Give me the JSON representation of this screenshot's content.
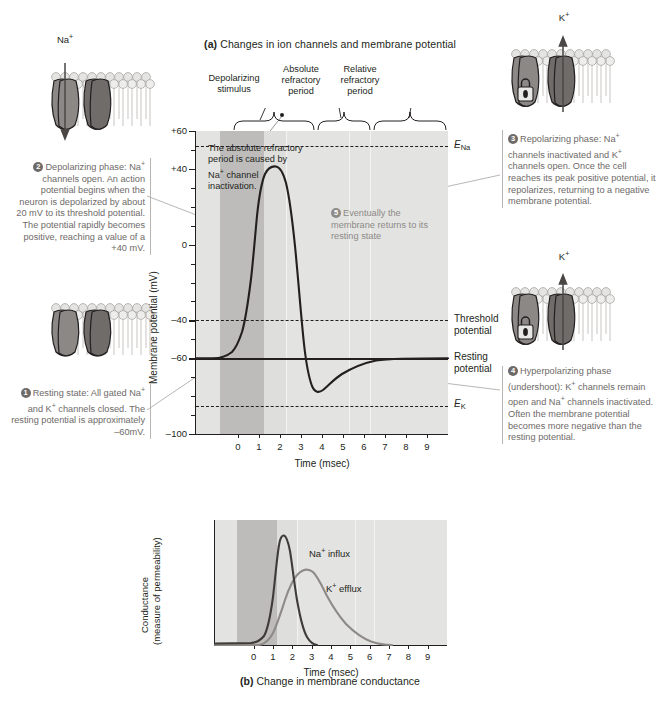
{
  "figure": {
    "title_a_prefix": "(a)",
    "title_a": "Changes in ion channels and membrane potential",
    "title_b_prefix": "(b)",
    "title_b": "Change in membrane conductance"
  },
  "membranes": [
    {
      "id": "na-open",
      "ion_label": "Na+",
      "arrow": "down"
    },
    {
      "id": "all-closed",
      "ion_label": "",
      "arrow": "none"
    },
    {
      "id": "k-open-1",
      "ion_label": "K+",
      "arrow": "up"
    },
    {
      "id": "k-open-2",
      "ion_label": "K+",
      "arrow": "up"
    }
  ],
  "callouts": [
    {
      "num": "1",
      "side": "left",
      "text": "Resting state: All gated Na+ and K+ channels closed. The resting potential is approximately –60mV."
    },
    {
      "num": "2",
      "side": "left",
      "text": "Depolarizing phase: Na+ channels open. An action potential begins when the neuron is depolarized by about 20 mV to its threshold potential. The potential rapidly becomes positive, reaching a value of a +40 mV."
    },
    {
      "num": "3",
      "side": "right",
      "text": "Repolarizing phase: Na+ channels inactivated and K+ channels open. Once the cell reaches its peak positive potential, it repolarizes, returning to a negative membrane potential."
    },
    {
      "num": "4",
      "side": "right",
      "text": "Hyperpolarizing phase (undershoot): K+ channels remain open and Na+ channels inactivated. Often the membrane potential becomes more negative than the resting potential."
    },
    {
      "num": "5",
      "side": "inner",
      "text": "Eventually the membrane returns to its resting state"
    }
  ],
  "brackets": [
    {
      "label": "Depolarizing stimulus"
    },
    {
      "label": "Absolute refractory period"
    },
    {
      "label": "Relative refractory period"
    }
  ],
  "inner_note": "The absolute refractory period is caused by Na+ channel inactivation.",
  "chart_data": [
    {
      "id": "chart-a",
      "type": "line",
      "title": "Changes in ion channels and membrane potential",
      "xlabel": "Time (msec)",
      "ylabel": "Membrane potential (mV)",
      "xlim": [
        -2,
        10
      ],
      "ylim": [
        -100,
        60
      ],
      "xticks": [
        0,
        1,
        2,
        3,
        4,
        5,
        6,
        7,
        8,
        9
      ],
      "yticks_major": [
        60,
        40,
        0,
        -40,
        -60,
        -100
      ],
      "yticks_minor": [
        50,
        30,
        20,
        10,
        -10,
        -20,
        -30,
        -50,
        -70,
        -80,
        -90
      ],
      "grid": false,
      "reference_lines": [
        {
          "name": "E_Na",
          "label": "E",
          "sub": "Na",
          "value": 52,
          "style": "dashed"
        },
        {
          "name": "threshold-potential",
          "label": "Threshold potential",
          "value": -40,
          "style": "dashed"
        },
        {
          "name": "resting-potential",
          "label": "Resting potential",
          "value": -60,
          "style": "solid"
        },
        {
          "name": "E_K",
          "label": "E",
          "sub": "K",
          "value": -85,
          "style": "dashed"
        }
      ],
      "shaded_regions": [
        {
          "name": "depolarizing-stimulus",
          "x0": -1.2,
          "x1": 0.9,
          "shade": "dark"
        },
        {
          "name": "absolute-refractory",
          "x0": 0.9,
          "x1": 1.9,
          "shade": "mid"
        }
      ],
      "series": [
        {
          "name": "membrane-potential",
          "color": "#231f20",
          "points": [
            [
              -2,
              -60
            ],
            [
              -1.2,
              -60
            ],
            [
              -0.6,
              -59.5
            ],
            [
              -0.2,
              -58
            ],
            [
              0.1,
              -55
            ],
            [
              0.35,
              -50
            ],
            [
              0.55,
              -43
            ],
            [
              0.7,
              -33
            ],
            [
              0.82,
              -18
            ],
            [
              0.95,
              2
            ],
            [
              1.1,
              22
            ],
            [
              1.25,
              33
            ],
            [
              1.45,
              38
            ],
            [
              1.6,
              38
            ],
            [
              1.75,
              33
            ],
            [
              1.9,
              22
            ],
            [
              2.05,
              5
            ],
            [
              2.2,
              -20
            ],
            [
              2.35,
              -45
            ],
            [
              2.5,
              -62
            ],
            [
              2.65,
              -71
            ],
            [
              2.85,
              -75
            ],
            [
              3.1,
              -76
            ],
            [
              3.4,
              -74
            ],
            [
              3.8,
              -71
            ],
            [
              4.3,
              -68
            ],
            [
              5,
              -65
            ],
            [
              5.8,
              -62
            ],
            [
              6.5,
              -60.5
            ],
            [
              7.5,
              -60
            ],
            [
              10,
              -60
            ]
          ]
        }
      ]
    },
    {
      "id": "chart-b",
      "type": "line",
      "title": "Change in membrane conductance",
      "xlabel": "Time (msec)",
      "ylabel": "Conductance (measure of permeability)",
      "xlim": [
        -2,
        10
      ],
      "ylim": [
        0,
        1
      ],
      "xticks": [
        0,
        1,
        2,
        3,
        4,
        5,
        6,
        7,
        8,
        9
      ],
      "grid": false,
      "shaded_regions": [
        {
          "name": "depolarizing-stimulus",
          "x0": -1.2,
          "x1": 0.9,
          "shade": "dark"
        },
        {
          "name": "absolute-refractory",
          "x0": 0.9,
          "x1": 1.9,
          "shade": "mid"
        }
      ],
      "series": [
        {
          "name": "Na+ influx",
          "label": "Na+ influx",
          "color": "#3f3b39",
          "points": [
            [
              -2,
              0.01
            ],
            [
              -0.5,
              0.015
            ],
            [
              0.1,
              0.03
            ],
            [
              0.4,
              0.06
            ],
            [
              0.65,
              0.15
            ],
            [
              0.82,
              0.45
            ],
            [
              0.95,
              0.82
            ],
            [
              1.08,
              0.95
            ],
            [
              1.2,
              0.93
            ],
            [
              1.35,
              0.78
            ],
            [
              1.5,
              0.55
            ],
            [
              1.7,
              0.33
            ],
            [
              1.9,
              0.18
            ],
            [
              2.15,
              0.08
            ],
            [
              2.45,
              0.03
            ],
            [
              2.8,
              0.005
            ],
            [
              3.0,
              0.0
            ]
          ]
        },
        {
          "name": "K+ efflux",
          "label": "K+ efflux",
          "color": "#8d8a87",
          "points": [
            [
              -2,
              0.0
            ],
            [
              0.3,
              0.0
            ],
            [
              0.7,
              0.02
            ],
            [
              1.0,
              0.1
            ],
            [
              1.3,
              0.26
            ],
            [
              1.6,
              0.41
            ],
            [
              1.9,
              0.52
            ],
            [
              2.2,
              0.58
            ],
            [
              2.5,
              0.6
            ],
            [
              2.8,
              0.58
            ],
            [
              3.2,
              0.5
            ],
            [
              3.7,
              0.4
            ],
            [
              4.2,
              0.31
            ],
            [
              4.8,
              0.23
            ],
            [
              5.5,
              0.15
            ],
            [
              6.2,
              0.08
            ],
            [
              6.8,
              0.03
            ],
            [
              7.2,
              0.0
            ]
          ]
        }
      ]
    }
  ]
}
